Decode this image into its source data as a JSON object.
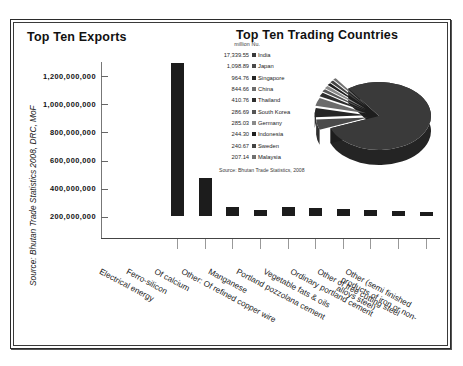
{
  "figure": {
    "source_vertical": "Source: Bhutan Trade Statistics 2008, DRC, MoF"
  },
  "exports_panel": {
    "title": "Top Ten Exports"
  },
  "countries_panel": {
    "title": "Top Ten Trading Countries",
    "legend_header": "million Nu.",
    "legend_source": "Source: Bhutan Trade Statistics, 2008"
  },
  "chart_data": [
    {
      "type": "bar",
      "title": "Top Ten Exports",
      "xlabel": "",
      "ylabel": "",
      "ylim": [
        0,
        1300000000
      ],
      "grid": false,
      "yticks": [
        "200,000,000",
        "400,000,000",
        "600,000,000",
        "800,000,000",
        "1,000,000,000",
        "1,200,000,000"
      ],
      "categories": [
        "Electrical energy",
        "Ferro-silicon",
        "Of calcium",
        "Other: Of refined copper wire",
        "Manganese",
        "Portland pozzolana cement",
        "Vegetable fats & oils",
        "Ordinary portland cement",
        "Other of free cutting steel",
        "Other (semi finished products of iron or non-alloys steel)"
      ],
      "values": [
        1090000000,
        268000000,
        66000000,
        45000000,
        62000000,
        58000000,
        48000000,
        40000000,
        33000000,
        30000000
      ],
      "bar_color": "#1c1c1c"
    },
    {
      "type": "pie",
      "title": "Top Ten Trading Countries",
      "unit": "million Nu.",
      "source": "Source: Bhutan Trade Statistics, 2008",
      "legend_position": "left",
      "labels": [
        "India",
        "Japan",
        "Singapore",
        "China",
        "Thailand",
        "South Korea",
        "Germany",
        "Indonesia",
        "Sweden",
        "Malaysia"
      ],
      "values": [
        17339.55,
        1098.89,
        964.76,
        844.66,
        410.76,
        286.69,
        285.03,
        244.3,
        240.67,
        207.14
      ],
      "value_labels": [
        "17,339.55",
        "1,098.89",
        "964.76",
        "844.66",
        "410.76",
        "286.69",
        "285.03",
        "244.30",
        "240.67",
        "207.14"
      ],
      "colors": [
        "#3a3a3a",
        "#4a4a4a",
        "#262626",
        "#6b6b6b",
        "#2e2e2e",
        "#555555",
        "#8a8a8a",
        "#1f1f1f",
        "#444444",
        "#707070"
      ]
    }
  ]
}
